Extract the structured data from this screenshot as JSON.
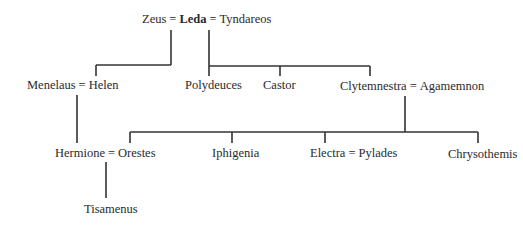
{
  "generation1": {
    "zeus": "Zeus",
    "eq1": "=",
    "leda": "Leda",
    "eq2": "=",
    "tyndareos": "Tyndareos"
  },
  "generation2": {
    "menelaus": "Menelaus",
    "eq_menelaus": "=",
    "helen": "Helen",
    "polydeuces": "Polydeuces",
    "castor": "Castor",
    "clytemnestra": "Clytemnestra",
    "eq_clytemnestra": "=",
    "agamemnon": "Agamemnon"
  },
  "generation3": {
    "hermione": "Hermione",
    "eq_hermione": "=",
    "orestes": "Orestes",
    "iphigenia": "Iphigenia",
    "electra": "Electra",
    "eq_electra": "=",
    "pylades": "Pylades",
    "chrysothemis": "Chrysothemis"
  },
  "generation4": {
    "tisamenus": "Tisamenus"
  },
  "colors": {
    "line": "#333333",
    "text": "#2a2a2a",
    "background": "#ffffff"
  }
}
